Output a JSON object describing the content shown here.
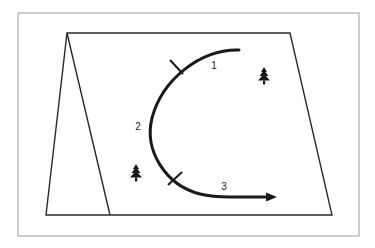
{
  "diagram": {
    "type": "route-map-sketch",
    "frame": {
      "x": 18,
      "y": 13,
      "width": 341,
      "height": 223,
      "stroke": "#9a9a9a"
    },
    "map_panel": {
      "outline": [
        [
          67,
          33
        ],
        [
          290,
          33
        ],
        [
          332,
          215
        ],
        [
          46,
          215
        ]
      ],
      "inner_fold_line": [
        [
          67,
          33
        ],
        [
          110,
          215
        ]
      ],
      "stroke": "#2a2a2a"
    },
    "route": {
      "stroke": "#1a1a1a",
      "arrow_tip": [
        277,
        197
      ],
      "segments": [
        {
          "id": "1",
          "label": "1"
        },
        {
          "id": "2",
          "label": "2"
        },
        {
          "id": "3",
          "label": "3"
        }
      ]
    },
    "labels": [
      {
        "text": "1",
        "x": 214,
        "y": 66
      },
      {
        "text": "2",
        "x": 138,
        "y": 127
      },
      {
        "text": "3",
        "x": 224,
        "y": 187
      }
    ],
    "trees": [
      {
        "icon": "pine-tree-icon",
        "x": 264,
        "y": 76
      },
      {
        "icon": "pine-tree-icon",
        "x": 136,
        "y": 173
      }
    ]
  }
}
